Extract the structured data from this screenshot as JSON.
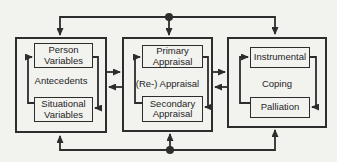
{
  "colors": {
    "background": "#f2f2ef",
    "ink": "#2d2d2d",
    "text": "#1f1f1f"
  },
  "diagram": {
    "groups": [
      {
        "name": "antecedents",
        "top_box": {
          "line1": "Person",
          "line2": "Variables"
        },
        "center_label": "Antecedents",
        "bottom_box": {
          "line1": "Situational",
          "line2": "Variables"
        }
      },
      {
        "name": "appraisal",
        "top_box": {
          "line1": "Primary",
          "line2": "Appraisal"
        },
        "center_label": "(Re-) Appraisal",
        "bottom_box": {
          "line1": "Secondary",
          "line2": "Appraisal"
        }
      },
      {
        "name": "coping",
        "top_box": {
          "line1": "Instrumental"
        },
        "center_label": "Coping",
        "bottom_box": {
          "line1": "Palliation"
        }
      }
    ]
  }
}
